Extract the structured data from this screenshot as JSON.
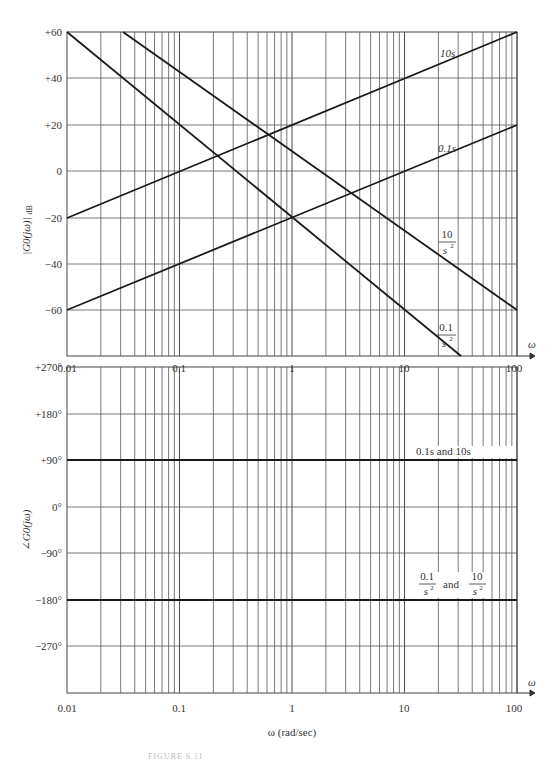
{
  "chart_data": [
    {
      "type": "line",
      "title": "Bode magnitude plot",
      "xscale": "log",
      "xlabel": "ω",
      "ylabel": "|G0(jω)| dB",
      "xlim": [
        0.01,
        100
      ],
      "ylim": [
        -80,
        60
      ],
      "x_ticks": [
        "0.01",
        "0.1",
        "1",
        "10",
        "100"
      ],
      "y_ticks": [
        "+60",
        "+40",
        "+20",
        "0",
        "-20",
        "-40",
        "-60"
      ],
      "grid": true,
      "series": [
        {
          "name": "10s",
          "x": [
            0.01,
            100
          ],
          "y": [
            -20,
            60
          ],
          "slope_db_per_decade": 20
        },
        {
          "name": "0.1s",
          "x": [
            0.01,
            100
          ],
          "y": [
            -60,
            20
          ],
          "slope_db_per_decade": 20
        },
        {
          "name": "10/s^2",
          "x": [
            0.01,
            100
          ],
          "y": [
            100,
            -60
          ],
          "visible_x": [
            0.0316,
            100
          ],
          "visible_y": [
            60,
            -60
          ],
          "slope_db_per_decade": -40
        },
        {
          "name": "0.1/s^2",
          "x": [
            0.01,
            100
          ],
          "y": [
            60,
            -100
          ],
          "visible_x": [
            0.01,
            31.6
          ],
          "visible_y": [
            60,
            -80
          ],
          "slope_db_per_decade": -40
        }
      ],
      "annotations": [
        "10s",
        "0.1s",
        "10/s²",
        "0.1/s²"
      ]
    },
    {
      "type": "line",
      "title": "Bode phase plot",
      "xscale": "log",
      "xlabel": "ω (rad/sec)",
      "ylabel": "∠G0(jω)",
      "xlim": [
        0.01,
        100
      ],
      "ylim": [
        -360,
        270
      ],
      "x_ticks": [
        "0.01",
        "0.1",
        "1",
        "10",
        "100"
      ],
      "y_ticks": [
        "+270°",
        "+180°",
        "+90°",
        "0°",
        "-90°",
        "-180°",
        "-270°"
      ],
      "grid": true,
      "series": [
        {
          "name": "0.1s and 10s",
          "x": [
            0.01,
            100
          ],
          "y": [
            90,
            90
          ]
        },
        {
          "name": "0.1/s^2 and 10/s^2",
          "x": [
            0.01,
            100
          ],
          "y": [
            -180,
            -180
          ]
        }
      ],
      "annotations": [
        "0.1s and 10s",
        "0.1/s² and 10/s²"
      ]
    }
  ],
  "labels": {
    "mag_ylabel": "|G0(jω)|",
    "mag_ylabel_unit": "dB",
    "phase_ylabel": "∠G0(jω)",
    "omega": "ω",
    "xlabel": "ω (rad/sec)",
    "x_ticks": [
      "0.01",
      "0.1",
      "1",
      "10",
      "100"
    ],
    "mag_y_ticks": [
      "+60",
      "+40",
      "+20",
      "0",
      "−20",
      "−40",
      "−60"
    ],
    "phase_y_ticks": [
      "+270°",
      "+180°",
      "+90°",
      "0°",
      "−90°",
      "−180°",
      "−270°"
    ],
    "ann_10s": "10s",
    "ann_01s": "0.1s",
    "ann_10_num": "10",
    "ann_01_num": "0.1",
    "ann_den": "s",
    "ann_den_exp": "2",
    "ann_phase_pos": "0.1s and 10s",
    "ann_and": "and",
    "caption": "FIGURE 6.11"
  }
}
